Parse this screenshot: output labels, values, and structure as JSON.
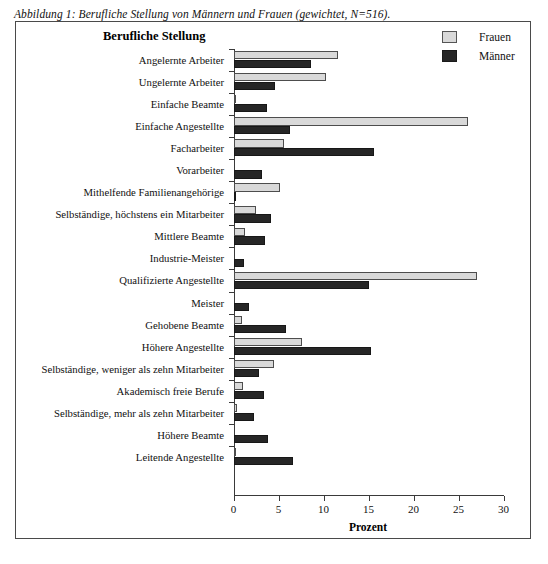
{
  "figure": {
    "caption": "Abbildung 1: Berufliche Stellung von Männern und Frauen (gewichtet, N=516).",
    "axis_group_title": "Berufliche Stellung"
  },
  "legend": {
    "items": [
      {
        "label": "Frauen",
        "color": "#d9d9d9"
      },
      {
        "label": "Männer",
        "color": "#262626"
      }
    ]
  },
  "chart_data": {
    "type": "bar",
    "orientation": "horizontal",
    "title": "Abbildung 1: Berufliche Stellung von Männern und Frauen (gewichtet, N=516).",
    "xlabel": "Prozent",
    "ylabel": "Berufliche Stellung",
    "xlim": [
      0,
      30
    ],
    "xticks": [
      0,
      5,
      10,
      15,
      20,
      25,
      30
    ],
    "grid": false,
    "legend_position": "top-right",
    "categories": [
      "Angelernte Arbeiter",
      "Ungelernte Arbeiter",
      "Einfache Beamte",
      "Einfache Angestellte",
      "Facharbeiter",
      "Vorarbeiter",
      "Mithelfende Familienangehörige",
      "Selbständige, höchstens ein Mitarbeiter",
      "Mittlere Beamte",
      "Industrie-Meister",
      "Qualifizierte Angestellte",
      "Meister",
      "Gehobene Beamte",
      "Höhere Angestellte",
      "Selbständige, weniger als zehn Mitarbeiter",
      "Akademisch freie Berufe",
      "Selbständige, mehr als zehn Mitarbeiter",
      "Höhere Beamte",
      "Leitende Angestellte"
    ],
    "series": [
      {
        "name": "Frauen",
        "color": "#d9d9d9",
        "values": [
          11.5,
          10.2,
          0.2,
          26.0,
          5.5,
          0.0,
          5.1,
          2.4,
          1.2,
          0.0,
          27.0,
          0.0,
          0.9,
          7.6,
          4.4,
          1.0,
          0.3,
          0.0,
          0.2
        ]
      },
      {
        "name": "Männer",
        "color": "#262626",
        "values": [
          8.6,
          4.6,
          3.7,
          6.2,
          15.5,
          3.1,
          0.2,
          4.1,
          3.4,
          1.1,
          15.0,
          1.7,
          5.8,
          15.2,
          2.8,
          3.3,
          2.2,
          3.8,
          6.5
        ]
      }
    ]
  }
}
